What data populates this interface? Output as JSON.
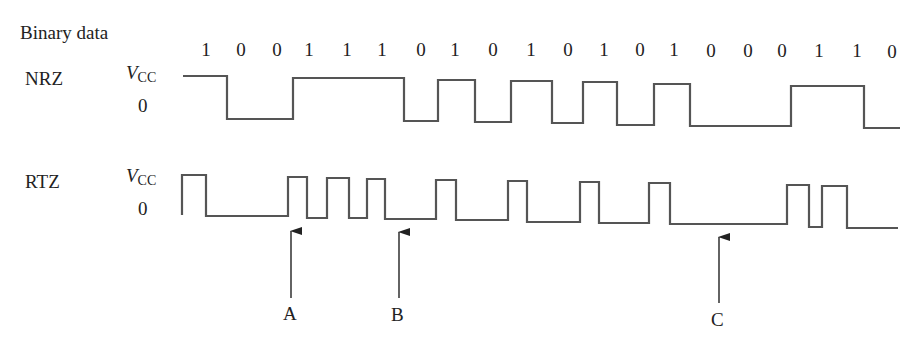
{
  "title_label": "Binary data",
  "bits": [
    "1",
    "0",
    "0",
    "1",
    "1",
    "1",
    "0",
    "1",
    "0",
    "1",
    "0",
    "1",
    "0",
    "1",
    "0",
    "0",
    "0",
    "1",
    "1",
    "0"
  ],
  "rows": {
    "nrz": {
      "label": "NRZ",
      "high_label_v": "V",
      "high_label_sub": "CC",
      "low_label": "0"
    },
    "rtz": {
      "label": "RTZ",
      "high_label_v": "V",
      "high_label_sub": "CC",
      "low_label": "0"
    }
  },
  "markers": [
    {
      "label": "A"
    },
    {
      "label": "B"
    },
    {
      "label": "C"
    }
  ],
  "colors": {
    "waveform": "#555555",
    "text": "#222222",
    "arrow": "#222222"
  }
}
